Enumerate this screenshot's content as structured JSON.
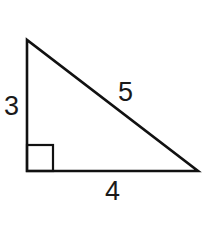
{
  "figure": {
    "type": "right-triangle",
    "stroke_color": "#111111",
    "background": "#ffffff",
    "vertices": {
      "top": [
        27,
        40
      ],
      "right_angle": [
        27,
        171
      ],
      "right": [
        198,
        171
      ]
    },
    "right_angle_marker": {
      "x": 27,
      "y": 145,
      "size": 26
    },
    "labels": {
      "vertical_leg": "3",
      "horizontal_leg": "4",
      "hypotenuse": "5"
    }
  }
}
